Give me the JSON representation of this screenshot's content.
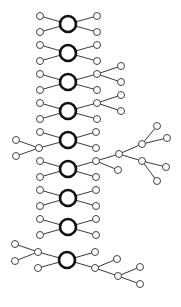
{
  "diagram": {
    "type": "tree-network",
    "colors": {
      "hub_stroke": "#111111",
      "leaf_stroke": "#444444",
      "edge": "#3a3a3a",
      "background": "#ffffff"
    },
    "hub_radius": 8,
    "leaf_radius": 3.5,
    "hubs": [
      {
        "id": "h1",
        "x": 68,
        "y": 24
      },
      {
        "id": "h2",
        "x": 68,
        "y": 53
      },
      {
        "id": "h3",
        "x": 68,
        "y": 82
      },
      {
        "id": "h4",
        "x": 68,
        "y": 111
      },
      {
        "id": "h5",
        "x": 68,
        "y": 140
      },
      {
        "id": "h6",
        "x": 68,
        "y": 169
      },
      {
        "id": "h7",
        "x": 68,
        "y": 198
      },
      {
        "id": "h8",
        "x": 68,
        "y": 227
      },
      {
        "id": "h9",
        "x": 67,
        "y": 260
      }
    ],
    "leaves": [
      {
        "id": "h1l1",
        "x": 40,
        "y": 16,
        "parent": "h1"
      },
      {
        "id": "h1l2",
        "x": 40,
        "y": 32,
        "parent": "h1"
      },
      {
        "id": "h1r1",
        "x": 97,
        "y": 16,
        "parent": "h1"
      },
      {
        "id": "h1r2",
        "x": 97,
        "y": 32,
        "parent": "h1"
      },
      {
        "id": "h2l1",
        "x": 40,
        "y": 45,
        "parent": "h2"
      },
      {
        "id": "h2l2",
        "x": 40,
        "y": 61,
        "parent": "h2"
      },
      {
        "id": "h2r1",
        "x": 97,
        "y": 45,
        "parent": "h2"
      },
      {
        "id": "h2r2",
        "x": 97,
        "y": 61,
        "parent": "h2"
      },
      {
        "id": "h3l1",
        "x": 40,
        "y": 74,
        "parent": "h3"
      },
      {
        "id": "h3l2",
        "x": 40,
        "y": 90,
        "parent": "h3"
      },
      {
        "id": "h3r1",
        "x": 97,
        "y": 74,
        "parent": "h3"
      },
      {
        "id": "h3r2",
        "x": 97,
        "y": 90,
        "parent": "h3"
      },
      {
        "id": "h3r1a",
        "x": 121,
        "y": 66,
        "parent": "h3r1"
      },
      {
        "id": "h3r1b",
        "x": 121,
        "y": 82,
        "parent": "h3r1"
      },
      {
        "id": "h4l1",
        "x": 40,
        "y": 103,
        "parent": "h4"
      },
      {
        "id": "h4l2",
        "x": 40,
        "y": 119,
        "parent": "h4"
      },
      {
        "id": "h4r1",
        "x": 97,
        "y": 103,
        "parent": "h4"
      },
      {
        "id": "h4r2",
        "x": 97,
        "y": 119,
        "parent": "h4"
      },
      {
        "id": "h4r1a",
        "x": 121,
        "y": 95,
        "parent": "h4r1"
      },
      {
        "id": "h4r1b",
        "x": 121,
        "y": 111,
        "parent": "h4r1"
      },
      {
        "id": "h5l1",
        "x": 40,
        "y": 132,
        "parent": "h5"
      },
      {
        "id": "h5l2",
        "x": 39,
        "y": 148,
        "parent": "h5"
      },
      {
        "id": "h5r1",
        "x": 96,
        "y": 132,
        "parent": "h5"
      },
      {
        "id": "h5r2",
        "x": 96,
        "y": 148,
        "parent": "h5"
      },
      {
        "id": "h5l2a",
        "x": 16,
        "y": 140,
        "parent": "h5l2"
      },
      {
        "id": "h5l2b",
        "x": 16,
        "y": 156,
        "parent": "h5l2"
      },
      {
        "id": "h6l1",
        "x": 40,
        "y": 161,
        "parent": "h6"
      },
      {
        "id": "h6l2",
        "x": 40,
        "y": 177,
        "parent": "h6"
      },
      {
        "id": "h6r1",
        "x": 96,
        "y": 161,
        "parent": "h6"
      },
      {
        "id": "h6r2",
        "x": 96,
        "y": 177,
        "parent": "h6"
      },
      {
        "id": "h6r1a",
        "x": 119,
        "y": 154,
        "parent": "h6r1"
      },
      {
        "id": "h6r1b",
        "x": 118,
        "y": 170,
        "parent": "h6r1"
      },
      {
        "id": "h6r1a1",
        "x": 142,
        "y": 144,
        "parent": "h6r1a"
      },
      {
        "id": "h6r1a2",
        "x": 142,
        "y": 161,
        "parent": "h6r1a"
      },
      {
        "id": "h6r1a1a",
        "x": 157,
        "y": 126,
        "parent": "h6r1a1"
      },
      {
        "id": "h6r1a1b",
        "x": 167,
        "y": 138,
        "parent": "h6r1a1"
      },
      {
        "id": "h6r1a2a",
        "x": 166,
        "y": 167,
        "parent": "h6r1a2"
      },
      {
        "id": "h6r1a2b",
        "x": 157,
        "y": 181,
        "parent": "h6r1a2"
      },
      {
        "id": "h7l1",
        "x": 40,
        "y": 190,
        "parent": "h7"
      },
      {
        "id": "h7l2",
        "x": 40,
        "y": 206,
        "parent": "h7"
      },
      {
        "id": "h7r1",
        "x": 96,
        "y": 190,
        "parent": "h7"
      },
      {
        "id": "h7r2",
        "x": 96,
        "y": 206,
        "parent": "h7"
      },
      {
        "id": "h8l1",
        "x": 40,
        "y": 219,
        "parent": "h8"
      },
      {
        "id": "h8l2",
        "x": 40,
        "y": 235,
        "parent": "h8"
      },
      {
        "id": "h8r1",
        "x": 96,
        "y": 219,
        "parent": "h8"
      },
      {
        "id": "h8r2",
        "x": 96,
        "y": 235,
        "parent": "h8"
      },
      {
        "id": "h9l1",
        "x": 38,
        "y": 252,
        "parent": "h9"
      },
      {
        "id": "h9l2",
        "x": 38,
        "y": 268,
        "parent": "h9"
      },
      {
        "id": "h9r1",
        "x": 95,
        "y": 252,
        "parent": "h9"
      },
      {
        "id": "h9r2",
        "x": 95,
        "y": 268,
        "parent": "h9"
      },
      {
        "id": "h9l1a",
        "x": 15,
        "y": 244,
        "parent": "h9l1"
      },
      {
        "id": "h9l1b",
        "x": 15,
        "y": 261,
        "parent": "h9l1"
      },
      {
        "id": "h9r2a",
        "x": 117,
        "y": 259,
        "parent": "h9r2"
      },
      {
        "id": "h9r2b",
        "x": 118,
        "y": 276,
        "parent": "h9r2"
      },
      {
        "id": "h9r2b1",
        "x": 140,
        "y": 267,
        "parent": "h9r2b"
      },
      {
        "id": "h9r2b2",
        "x": 140,
        "y": 284,
        "parent": "h9r2b"
      }
    ]
  }
}
